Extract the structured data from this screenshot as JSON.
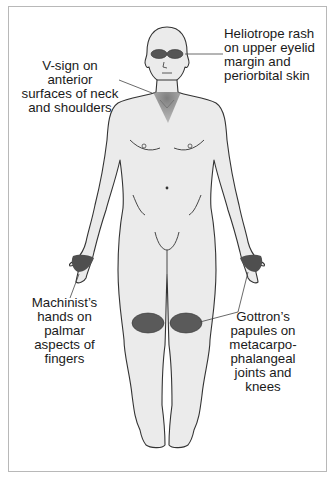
{
  "figure": {
    "labels": {
      "heliotrope": {
        "lines": [
          "Heliotrope rash",
          "on upper eyelid",
          "margin and",
          "periorbital skin"
        ]
      },
      "vsign": {
        "lines": [
          "V-sign on anterior",
          "surfaces of neck",
          "and shoulders"
        ]
      },
      "machinist": {
        "lines": [
          "Machinist’s",
          "hands on",
          "palmar",
          "aspects of",
          "fingers"
        ]
      },
      "gottron": {
        "lines": [
          "Gottron’s",
          "papules on",
          "metacarpo-",
          "phalangeal",
          "joints and",
          "knees"
        ]
      }
    },
    "colors": {
      "skin": "#ebebeb",
      "outline": "#333333",
      "lesion": "#5a5a5a",
      "frame": "#b8b8b8"
    }
  }
}
